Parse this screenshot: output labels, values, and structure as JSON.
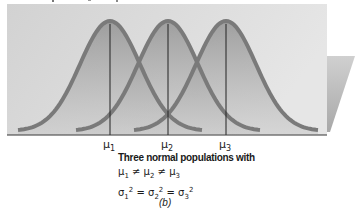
{
  "figure": {
    "panel_label": "(b)",
    "caption_title": "Three normal populations with",
    "mean_relation": {
      "parts": [
        "μ",
        "1",
        " ≠ ",
        "μ",
        "2",
        " ≠ ",
        "μ",
        "3"
      ]
    },
    "variance_relation": {
      "parts": [
        "σ",
        "1",
        "2",
        " = ",
        "σ",
        "2",
        "2",
        " = ",
        "σ",
        "3",
        "2"
      ]
    },
    "means": [
      {
        "symbol": "μ",
        "subscript": "1",
        "x": 110
      },
      {
        "symbol": "μ",
        "subscript": "2",
        "x": 168
      },
      {
        "symbol": "μ",
        "subscript": "3",
        "x": 226
      }
    ],
    "colors": {
      "panel": "#d6d6d6",
      "panel_light": "#e4e4e4",
      "curve_fill_top": "#8e8e8e",
      "curve_fill_bottom": "#c4c4c4",
      "curve_stroke": "#7a7a7a",
      "mean_line": "#222222",
      "axis": "#333333",
      "side_plane": "#bdbdbd"
    }
  },
  "chart_data": {
    "type": "area",
    "xlabel": "",
    "ylabel": "",
    "x_ticks": [
      "μ1",
      "μ2",
      "μ3"
    ],
    "series": [
      {
        "name": "Population 1",
        "mean": "μ1",
        "sd": "σ1",
        "center_px": 110
      },
      {
        "name": "Population 2",
        "mean": "μ2",
        "sd": "σ2",
        "center_px": 168
      },
      {
        "name": "Population 3",
        "mean": "μ3",
        "sd": "σ3",
        "center_px": 226
      }
    ],
    "grid": false,
    "legend": "none",
    "panel_label": "(b)"
  }
}
